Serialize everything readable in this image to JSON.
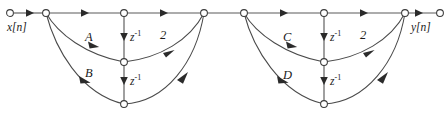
{
  "diagram": {
    "type": "signal-flow-graph",
    "input_label": "x[n]",
    "output_label": "y[n]",
    "delay_label": "z",
    "delay_exponent": "-1",
    "gain_label": "2",
    "coefficients": [
      "A",
      "B",
      "C",
      "D"
    ],
    "sections": [
      {
        "name": "section-1",
        "feedback_coefficients": [
          "A",
          "B"
        ],
        "feedforward_gain": "2",
        "delays": [
          "z-1",
          "z-1"
        ]
      },
      {
        "name": "section-2",
        "feedback_coefficients": [
          "C",
          "D"
        ],
        "feedforward_gain": "2",
        "delays": [
          "z-1",
          "z-1"
        ]
      }
    ],
    "labels": {
      "input": "x[n]",
      "output": "y[n]",
      "a": "A",
      "b": "B",
      "c": "C",
      "d": "D",
      "gain1": "2",
      "gain2": "2",
      "delay_base": "z",
      "delay_sup": "-1"
    },
    "colors": {
      "line": "#4a4a4a",
      "arrow": "#2b2b2b",
      "node_stroke": "#3a3a3a",
      "node_fill": "#ffffff",
      "text": "#1a1a1a",
      "background": "#ffffff"
    },
    "nodes": {
      "input": {
        "x": 10,
        "y": 13
      },
      "s1_left": {
        "x": 46,
        "y": 13
      },
      "s1_top_mid": {
        "x": 124,
        "y": 13
      },
      "s1_right": {
        "x": 204,
        "y": 13
      },
      "s1_mid": {
        "x": 124,
        "y": 62
      },
      "s1_bot": {
        "x": 124,
        "y": 104
      },
      "s2_left": {
        "x": 244,
        "y": 13
      },
      "s2_top_mid": {
        "x": 324,
        "y": 13
      },
      "s2_right": {
        "x": 405,
        "y": 13
      },
      "s2_mid": {
        "x": 324,
        "y": 62
      },
      "s2_bot": {
        "x": 324,
        "y": 104
      },
      "output": {
        "x": 440,
        "y": 13
      }
    }
  }
}
